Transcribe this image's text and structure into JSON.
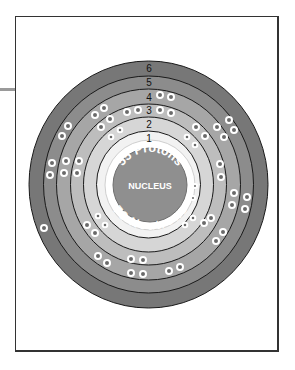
{
  "diagram": {
    "type": "bohr-atom-model",
    "nucleus": {
      "label": "NUCLEUS",
      "protons_text": "55 Protons",
      "neutrons_text": "78 Neutrons",
      "protons": 55,
      "neutrons": 78
    },
    "shells": [
      {
        "label": "1",
        "electrons": 2,
        "color": "#f2f2f2"
      },
      {
        "label": "2",
        "electrons": 8,
        "color": "#d6d6d6"
      },
      {
        "label": "3",
        "electrons": 18,
        "color": "#bdbdbd"
      },
      {
        "label": "4",
        "electrons": 18,
        "color": "#a6a6a6"
      },
      {
        "label": "5",
        "electrons": 8,
        "color": "#8c8c8c"
      },
      {
        "label": "6",
        "electrons": 1,
        "color": "#777777"
      }
    ],
    "colors": {
      "nucleus": "#8f8f8f",
      "nucleus_ring": "#ffffff",
      "shell_line": "#1a1a1a",
      "electron_fill": "#6a6a6a",
      "electron_ring": "#ffffff",
      "frame": "#333333",
      "leader_line": "#9a9a9a"
    }
  }
}
